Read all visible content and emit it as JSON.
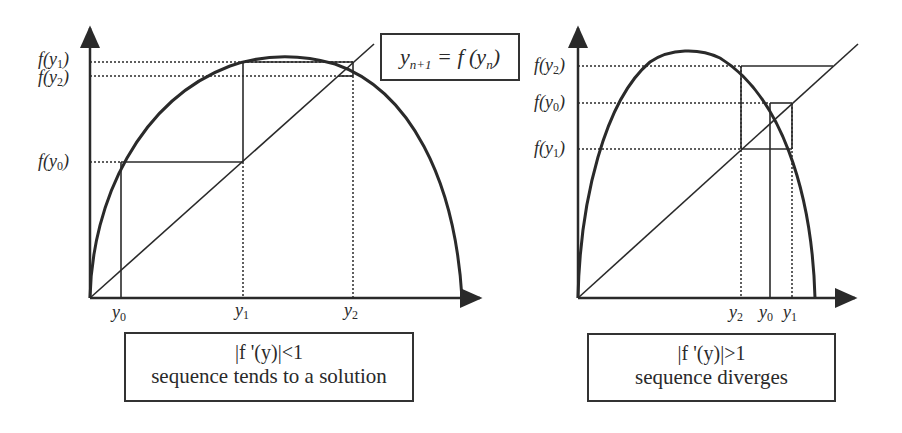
{
  "formula": {
    "lhs": "y",
    "lhs_sub": "n+1",
    "eq": " = f (y",
    "rhs_sub": "n",
    "close": ")"
  },
  "left_panel": {
    "y_axis_labels": [
      {
        "id": "fy1",
        "text": "f(y",
        "sub": "1",
        "close": ")"
      },
      {
        "id": "fy2",
        "text": "f(y",
        "sub": "2",
        "close": ")"
      },
      {
        "id": "fy0",
        "text": "f(y",
        "sub": "0",
        "close": ")"
      }
    ],
    "x_axis_labels": [
      {
        "text": "y",
        "sub": "0"
      },
      {
        "text": "y",
        "sub": "1"
      },
      {
        "text": "y",
        "sub": "2"
      }
    ],
    "caption": {
      "line1": "|f '(y)|<1",
      "line2": "sequence tends to a solution"
    }
  },
  "right_panel": {
    "y_axis_labels": [
      {
        "id": "fy2",
        "text": "f(y",
        "sub": "2",
        "close": ")"
      },
      {
        "id": "fy0",
        "text": "f(y",
        "sub": "0",
        "close": ")"
      },
      {
        "id": "fy1",
        "text": "f(y",
        "sub": "1",
        "close": ")"
      }
    ],
    "x_axis_labels": [
      {
        "text": "y",
        "sub": "2"
      },
      {
        "text": "y",
        "sub": "0"
      },
      {
        "text": "y",
        "sub": "1"
      }
    ],
    "caption": {
      "line1": "|f '(y)|>1",
      "line2": "sequence diverges"
    }
  },
  "colors": {
    "ink": "#2a2a2a",
    "background": "#ffffff"
  }
}
